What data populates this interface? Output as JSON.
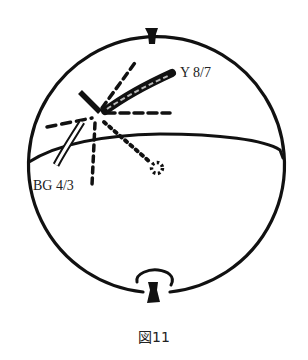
{
  "figure": {
    "caption": "図11",
    "labels": {
      "upper": "Y 8/7",
      "lower": "BG 4/3"
    },
    "colors": {
      "ink": "#111111",
      "background": "#ffffff"
    }
  }
}
